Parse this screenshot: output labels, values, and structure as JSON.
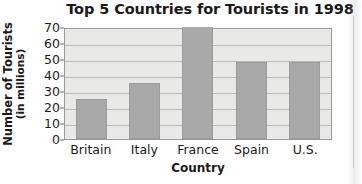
{
  "chart_data": {
    "type": "bar",
    "title": "Top 5 Countries for Tourists in 1998",
    "xlabel": "Country",
    "ylabel": "Number of Tourists",
    "ylabel_line2": "(in millions)",
    "categories": [
      "Britain",
      "Italy",
      "France",
      "Spain",
      "U.S."
    ],
    "values": [
      25,
      35,
      70,
      48,
      48
    ],
    "ylim": [
      0,
      70
    ],
    "ytick_step": 10,
    "yticks": [
      0,
      10,
      20,
      30,
      40,
      50,
      60,
      70
    ],
    "grid": true,
    "legend": false,
    "colors": {
      "bar_fill": "#a9a9a9",
      "bar_edge": "#9b9b9b",
      "plot_background": "#e9e9e7",
      "gridline": "#b9b9b7",
      "axis_border": "#9a9a9a",
      "text": "#1a1a1a",
      "page_background": "#ffffff"
    }
  }
}
